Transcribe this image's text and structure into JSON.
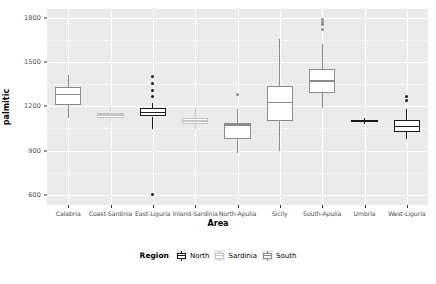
{
  "chart_data": {
    "type": "box",
    "title": "",
    "xlabel": "Area",
    "ylabel": "palmitic",
    "ylim": [
      530,
      1860
    ],
    "yticks": [
      600,
      900,
      1200,
      1500,
      1800
    ],
    "ytick_labels": [
      "600",
      "900",
      "1200",
      "1500",
      "1800"
    ],
    "grid": true,
    "legend": {
      "title": "Region",
      "position": "bottom",
      "entries": [
        {
          "name": "North",
          "color": "#1A1A1A"
        },
        {
          "name": "Sardinia",
          "color": "#C6C6C6"
        },
        {
          "name": "South",
          "color": "#8C8C8C"
        }
      ]
    },
    "categories": [
      "Calabria",
      "Coast-Sardinia",
      "East-Liguria",
      "Inland-Sardinia",
      "North-Apulia",
      "Sicily",
      "South-Apulia",
      "Umbria",
      "West-Liguria"
    ],
    "boxes": [
      {
        "area": "Calabria",
        "region": "South",
        "color": "#8C8C8C",
        "lower_whisker": 1120,
        "q1": 1210,
        "median": 1278,
        "q3": 1330,
        "upper_whisker": 1412,
        "outliers": []
      },
      {
        "area": "Coast-Sardinia",
        "region": "Sardinia",
        "color": "#C6C6C6",
        "lower_whisker": 1092,
        "q1": 1124,
        "median": 1140,
        "q3": 1158,
        "upper_whisker": 1192,
        "outliers": []
      },
      {
        "area": "East-Liguria",
        "region": "North",
        "color": "#1A1A1A",
        "lower_whisker": 1046,
        "q1": 1130,
        "median": 1158,
        "q3": 1190,
        "upper_whisker": 1225,
        "outliers": [
          1400,
          1352,
          1310,
          1268,
          603
        ]
      },
      {
        "area": "Inland-Sardinia",
        "region": "Sardinia",
        "color": "#C6C6C6",
        "lower_whisker": 1043,
        "q1": 1080,
        "median": 1100,
        "q3": 1118,
        "upper_whisker": 1190,
        "outliers": []
      },
      {
        "area": "North-Apulia",
        "region": "South",
        "color": "#8C8C8C",
        "lower_whisker": 882,
        "q1": 975,
        "median": 1072,
        "q3": 1090,
        "upper_whisker": 1185,
        "outliers": [
          1278
        ]
      },
      {
        "area": "Sicily",
        "region": "South",
        "color": "#8C8C8C",
        "lower_whisker": 900,
        "q1": 1100,
        "median": 1225,
        "q3": 1340,
        "upper_whisker": 1655,
        "outliers": []
      },
      {
        "area": "South-Apulia",
        "region": "South",
        "color": "#8C8C8C",
        "lower_whisker": 1185,
        "q1": 1292,
        "median": 1372,
        "q3": 1455,
        "upper_whisker": 1622,
        "outliers": [
          1790,
          1772,
          1752,
          1718
        ]
      },
      {
        "area": "Umbria",
        "region": "North",
        "color": "#1A1A1A",
        "lower_whisker": 1082,
        "q1": 1094,
        "median": 1100,
        "q3": 1106,
        "upper_whisker": 1118,
        "outliers": []
      },
      {
        "area": "West-Liguria",
        "region": "North",
        "color": "#1A1A1A",
        "lower_whisker": 978,
        "q1": 1028,
        "median": 1062,
        "q3": 1108,
        "upper_whisker": 1185,
        "outliers": [
          1268,
          1240
        ]
      }
    ]
  }
}
